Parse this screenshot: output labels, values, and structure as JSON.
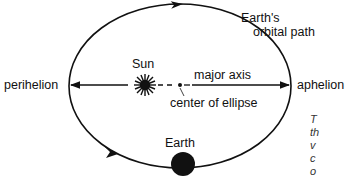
{
  "diagram": {
    "labels": {
      "orbital_path": [
        "Earth's",
        "orbital path"
      ],
      "sun": "Sun",
      "perihelion": "perihelion",
      "aphelion": "aphelion",
      "major_axis": "major axis",
      "center": "center of ellipse",
      "earth": "Earth"
    },
    "icons": {
      "sun": "starburst",
      "earth": "filled-circle",
      "center": "dot"
    },
    "colors": {
      "ink": "#111111",
      "background": "#ffffff",
      "caption": "#333333"
    }
  },
  "caption_fragment": [
    "T",
    "th",
    "v",
    "c",
    "o"
  ]
}
